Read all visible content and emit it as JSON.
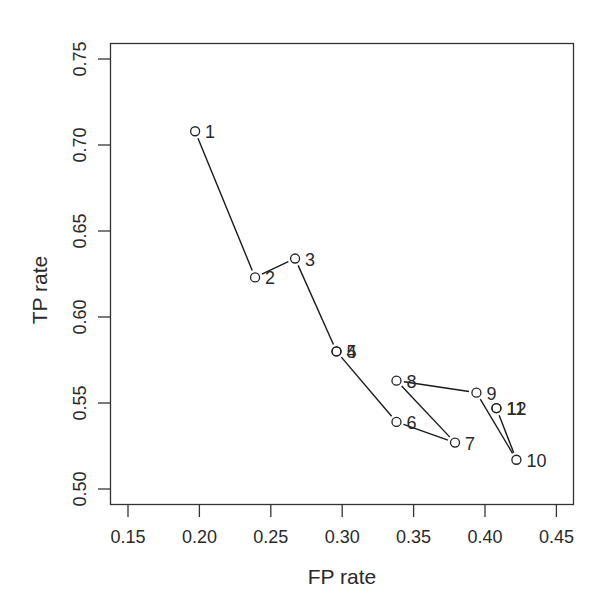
{
  "chart_data": {
    "type": "line",
    "title": "",
    "xlabel": "FP rate",
    "ylabel": "TP rate",
    "xlim": [
      0.14,
      0.465
    ],
    "ylim": [
      0.49,
      0.76
    ],
    "xticks": [
      "0.15",
      "0.20",
      "0.25",
      "0.30",
      "0.35",
      "0.40",
      "0.45"
    ],
    "yticks": [
      "0.50",
      "0.55",
      "0.60",
      "0.65",
      "0.70",
      "0.75"
    ],
    "grid": false,
    "legend": null,
    "marker": "open-circle",
    "series": [
      {
        "name": "path",
        "points": [
          {
            "label": "1",
            "fp": 0.197,
            "tp": 0.708
          },
          {
            "label": "2",
            "fp": 0.239,
            "tp": 0.623
          },
          {
            "label": "3",
            "fp": 0.267,
            "tp": 0.634
          },
          {
            "label": "4",
            "fp": 0.296,
            "tp": 0.58
          },
          {
            "label": "5",
            "fp": 0.296,
            "tp": 0.58
          },
          {
            "label": "6",
            "fp": 0.338,
            "tp": 0.539
          },
          {
            "label": "7",
            "fp": 0.379,
            "tp": 0.527
          },
          {
            "label": "8",
            "fp": 0.338,
            "tp": 0.563
          },
          {
            "label": "9",
            "fp": 0.394,
            "tp": 0.556
          },
          {
            "label": "10",
            "fp": 0.422,
            "tp": 0.517
          },
          {
            "label": "11",
            "fp": 0.408,
            "tp": 0.547
          },
          {
            "label": "12",
            "fp": 0.408,
            "tp": 0.547
          }
        ]
      }
    ]
  },
  "colors": {
    "line": "#1a1a1a",
    "axis": "#333333",
    "background": "#ffffff"
  }
}
